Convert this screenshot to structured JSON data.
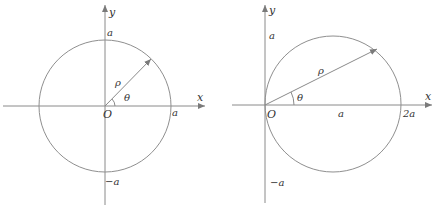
{
  "figures": [
    {
      "id": "circle-centered-at-origin",
      "equation_hint": "rho = a",
      "labels": {
        "x_axis": "x",
        "y_axis": "y",
        "origin": "O",
        "rho": "ρ",
        "theta": "θ",
        "x_tick": "a",
        "y_tick_top": "a",
        "y_tick_bottom": "−a"
      }
    },
    {
      "id": "circle-tangent-at-origin",
      "equation_hint": "rho = 2a cos(theta)",
      "labels": {
        "x_axis": "x",
        "y_axis": "y",
        "origin": "O",
        "rho": "ρ",
        "theta": "θ",
        "x_tick_mid": "a",
        "x_tick_end": "2a",
        "y_tick_top": "a",
        "y_tick_bottom": "−a"
      }
    }
  ],
  "colors": {
    "line": "#8a8a8a",
    "text": "#333333",
    "background": "#ffffff"
  }
}
